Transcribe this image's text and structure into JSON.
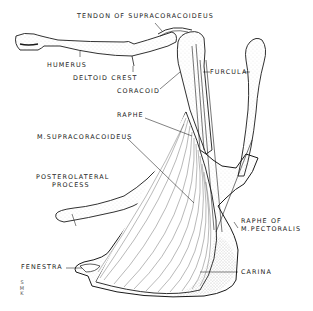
{
  "diagram": {
    "labels": {
      "tendon": "TENDON OF SUPRACORACOIDEUS",
      "humerus": "HUMERUS",
      "deltoid_crest": "DELTOID CREST",
      "coracoid": "CORACOID",
      "furcula": "FURCULA",
      "raphe": "RAPHE",
      "m_supracoracoideus": "M.SUPRACORACOIDEUS",
      "posterolateral_line1": "POSTEROLATERAL",
      "posterolateral_line2": "PROCESS",
      "raphe_pect_line1": "RAPHE OF",
      "raphe_pect_line2": "M.PECTORALIS",
      "fenestra": "FENESTRA",
      "carina": "CARINA"
    },
    "signature": [
      "S",
      "M",
      "K"
    ],
    "colors": {
      "ink": "#1a1a1a",
      "stipple": "#9a9a9a",
      "background": "#ffffff"
    }
  }
}
